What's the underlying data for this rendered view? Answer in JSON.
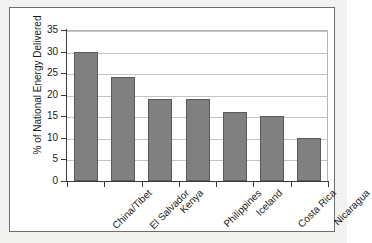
{
  "chart_data": {
    "type": "bar",
    "title": "",
    "xlabel": "",
    "ylabel": "% of National Energy Delivered",
    "categories": [
      "China/Tibet",
      "El Salvador",
      "Kenya",
      "Philippines",
      "Iceland",
      "Costa Rica",
      "Nicaragua"
    ],
    "values": [
      30,
      24,
      19,
      19,
      16,
      15,
      10
    ],
    "ylim": [
      0,
      35
    ],
    "ytick_labels": [
      "0",
      "5",
      "10",
      "15",
      "20",
      "25",
      "30",
      "35"
    ],
    "ytick_values": [
      0,
      5,
      10,
      15,
      20,
      25,
      30,
      35
    ],
    "grid": true,
    "legend": "none",
    "bar_color": "#808080",
    "bar_edge_color": "#5a5a5a",
    "gridline_color": "#c4c4c4",
    "axis_color": "#3a3a3a",
    "plot_background": "#ffffff",
    "figure_background": "#f2f2f1",
    "frame_border_color": "#6e6e6e"
  }
}
